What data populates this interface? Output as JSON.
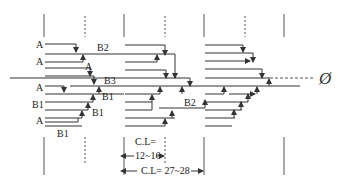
{
  "diagram": {
    "title": "",
    "colors": {
      "line": "#333333",
      "guide": "#777777",
      "text": "#222222",
      "background": "#ffffff"
    },
    "labels": {
      "a1": "A",
      "a2": "A",
      "a3": "A",
      "a4": "A",
      "a5": "A",
      "b2_top": "B2",
      "b3": "B3",
      "b1_left": "B1",
      "b1_mid1": "B1",
      "b1_mid2": "B1",
      "b1_bottom": "B1",
      "b2_right": "B2",
      "phi_symbol": "Ø"
    },
    "dimensions": {
      "cl_short_label": "C.L=",
      "cl_short_value": "12~16",
      "cl_long": "C.L= 27~28"
    }
  }
}
